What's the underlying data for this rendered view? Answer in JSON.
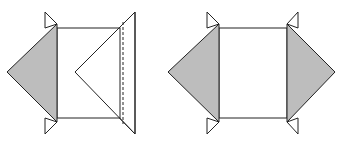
{
  "diagram": {
    "colors": {
      "background": "#ffffff",
      "stroke": "#222222",
      "fill_gray": "#bdbdbd",
      "fill_white": "#ffffff"
    },
    "figures": [
      {
        "id": "left-figure",
        "square": {
          "x": 57,
          "y": 28,
          "w": 63,
          "h": 90
        },
        "left_shaded_triangle": [
          [
            57,
            24
          ],
          [
            7,
            72
          ],
          [
            57,
            122
          ]
        ],
        "top_small_flap": [
          [
            45,
            12
          ],
          [
            57,
            24
          ],
          [
            45,
            28
          ]
        ],
        "bottom_small_flap": [
          [
            45,
            134
          ],
          [
            57,
            122
          ],
          [
            45,
            118
          ]
        ],
        "right_large_triangle": [
          [
            135,
            12
          ],
          [
            75,
            72
          ],
          [
            135,
            134
          ]
        ],
        "dashed_fold_line": {
          "x": 123,
          "y1": 22,
          "y2": 124
        }
      },
      {
        "id": "right-figure",
        "square": {
          "x": 219,
          "y": 28,
          "w": 68,
          "h": 90
        },
        "left_shaded_triangle": [
          [
            219,
            24
          ],
          [
            168,
            72
          ],
          [
            219,
            122
          ]
        ],
        "left_top_small_flap": [
          [
            207,
            12
          ],
          [
            219,
            24
          ],
          [
            207,
            28
          ]
        ],
        "left_bottom_small_flap": [
          [
            207,
            134
          ],
          [
            219,
            122
          ],
          [
            207,
            118
          ]
        ],
        "right_shaded_triangle": [
          [
            287,
            24
          ],
          [
            335,
            72
          ],
          [
            287,
            122
          ]
        ],
        "right_top_small_flap": [
          [
            298,
            12
          ],
          [
            287,
            24
          ],
          [
            298,
            28
          ]
        ],
        "right_bottom_small_flap": [
          [
            298,
            134
          ],
          [
            287,
            122
          ],
          [
            298,
            118
          ]
        ]
      }
    ]
  }
}
